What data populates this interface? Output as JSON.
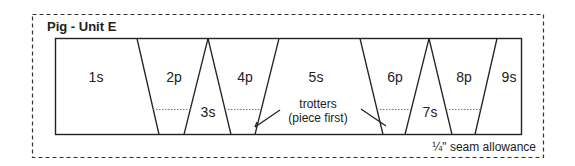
{
  "title": "Pig - Unit E",
  "pieces": [
    {
      "id": "1s",
      "label": "1s",
      "x": 96,
      "y": 77
    },
    {
      "id": "2p",
      "label": "2p",
      "x": 174,
      "y": 77
    },
    {
      "id": "3s",
      "label": "3s",
      "x": 208,
      "y": 114
    },
    {
      "id": "4p",
      "label": "4p",
      "x": 245,
      "y": 77
    },
    {
      "id": "5s",
      "label": "5s",
      "x": 316,
      "y": 77
    },
    {
      "id": "6p",
      "label": "6p",
      "x": 395,
      "y": 77
    },
    {
      "id": "7s",
      "label": "7s",
      "x": 429,
      "y": 114
    },
    {
      "id": "8p",
      "label": "8p",
      "x": 464,
      "y": 77
    },
    {
      "id": "9s",
      "label": "9s",
      "x": 509,
      "y": 77
    }
  ],
  "annotation": {
    "line1": "trotters",
    "line2": "(piece first)"
  },
  "seam_note": "¼\" seam allowance",
  "colors": {
    "line": "#222222",
    "dotted": "#777777",
    "background": "#ffffff"
  }
}
